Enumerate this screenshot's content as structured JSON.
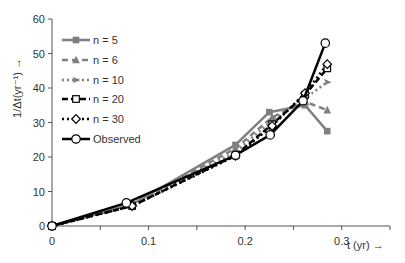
{
  "chart_data": {
    "type": "line",
    "title": "",
    "xlabel": "t (yr) →",
    "ylabel": "1/Δt(yr⁻¹) →",
    "xlim": [
      0,
      0.35
    ],
    "ylim": [
      0,
      60
    ],
    "xticks": [
      0,
      0.1,
      0.2,
      0.3
    ],
    "xtick_labels": [
      "0",
      "0.1",
      "0.2",
      "0.3"
    ],
    "xminor_ticks": [
      0.05,
      0.15,
      0.25,
      0.35
    ],
    "yticks": [
      0,
      10,
      20,
      30,
      40,
      50,
      60
    ],
    "ytick_labels": [
      "0",
      "10",
      "20",
      "30",
      "40",
      "50",
      "60"
    ],
    "grid": false,
    "legend_position": "upper left",
    "series": [
      {
        "name": "n = 5",
        "color": "#7f7f7f",
        "dash": "",
        "width": 2.5,
        "marker": "square-filled",
        "x": [
          0,
          0.083,
          0.19,
          0.225,
          0.262,
          0.285
        ],
        "y": [
          0,
          6.3,
          23.5,
          33,
          35,
          27.5
        ]
      },
      {
        "name": "n = 6",
        "color": "#7f7f7f",
        "dash": "6,4",
        "width": 2.5,
        "marker": "triangle-filled",
        "x": [
          0,
          0.083,
          0.19,
          0.228,
          0.262,
          0.285
        ],
        "y": [
          0,
          6.1,
          22.5,
          31.5,
          36,
          33.6
        ]
      },
      {
        "name": "n = 10",
        "color": "#7f7f7f",
        "dash": "2,3",
        "width": 2.5,
        "marker": "arrow-filled",
        "x": [
          0,
          0.083,
          0.19,
          0.228,
          0.262,
          0.285
        ],
        "y": [
          0,
          6.0,
          21.5,
          30.5,
          37,
          41.7
        ]
      },
      {
        "name": "n = 20",
        "color": "#000000",
        "dash": "6,3",
        "width": 2.5,
        "marker": "square-open",
        "x": [
          0,
          0.083,
          0.19,
          0.228,
          0.262,
          0.285
        ],
        "y": [
          0,
          5.8,
          20.5,
          29.5,
          38,
          45.7
        ]
      },
      {
        "name": "n = 30",
        "color": "#000000",
        "dash": "2,3",
        "width": 2.5,
        "marker": "diamond-open",
        "x": [
          0,
          0.083,
          0.19,
          0.228,
          0.262,
          0.285
        ],
        "y": [
          0,
          5.8,
          20.3,
          29,
          38.5,
          46.9
        ]
      },
      {
        "name": "Observed",
        "color": "#000000",
        "dash": "",
        "width": 2.5,
        "marker": "circle-open",
        "x": [
          0,
          0.077,
          0.19,
          0.226,
          0.26,
          0.283
        ],
        "y": [
          0,
          6.7,
          20.5,
          26.4,
          36.3,
          53
        ]
      }
    ]
  }
}
